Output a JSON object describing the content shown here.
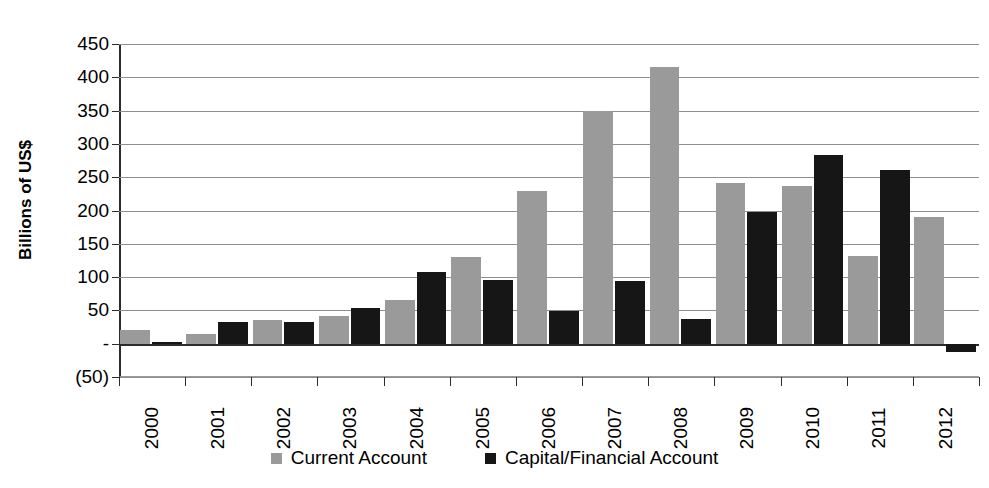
{
  "chart_data": {
    "type": "bar",
    "title": "",
    "xlabel": "",
    "ylabel": "Billions of US$",
    "categories": [
      "2000",
      "2001",
      "2002",
      "2003",
      "2004",
      "2005",
      "2006",
      "2007",
      "2008",
      "2009",
      "2010",
      "2011",
      "2012"
    ],
    "series": [
      {
        "name": "Current Account",
        "color": "#9a9a9a",
        "values": [
          20,
          15,
          35,
          41,
          66,
          130,
          230,
          350,
          416,
          242,
          237,
          132,
          190
        ]
      },
      {
        "name": "Capital/Financial Account",
        "color": "#161616",
        "values": [
          2,
          33,
          32,
          53,
          107,
          95,
          49,
          94,
          37,
          197,
          284,
          261,
          -13
        ]
      }
    ],
    "ylim": [
      -50,
      450
    ],
    "y_ticks": [
      450,
      400,
      350,
      300,
      250,
      200,
      150,
      100,
      50,
      0,
      -50
    ],
    "y_tick_labels": [
      "450",
      "400",
      "350",
      "300",
      "250",
      "200",
      "150",
      "100",
      "50",
      "-",
      "(50)"
    ],
    "grid": true,
    "legend_position": "bottom"
  },
  "legend": {
    "items": [
      {
        "label": "Current Account",
        "swatch": "series-current"
      },
      {
        "label": "Capital/Financial Account",
        "swatch": "series-capital"
      }
    ]
  }
}
